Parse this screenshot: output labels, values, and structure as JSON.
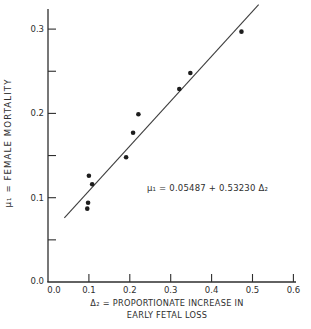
{
  "figure": {
    "background": "#ffffff",
    "ink_color": "#2e2e2e",
    "y_axis_title": "μ₁ = FEMALE  MORTALITY",
    "x_axis_title_line1": "Δ₂ = PROPORTIONATE  INCREASE  IN",
    "x_axis_title_line2": "EARLY  FETAL  LOSS",
    "annotation": "μ₁ = 0.05487 + 0.53230 Δ₂"
  },
  "chart_data": {
    "type": "scatter",
    "title": "",
    "xlabel": "Δ₂ = PROPORTIONATE INCREASE IN EARLY FETAL LOSS",
    "ylabel": "μ₁ = FEMALE MORTALITY",
    "xlim": [
      0,
      0.62
    ],
    "ylim": [
      0,
      0.323
    ],
    "grid": false,
    "legend": null,
    "x_major_ticks": [
      0,
      0.1,
      0.2,
      0.3,
      0.4,
      0.5,
      0.6
    ],
    "x_tick_labels": [
      "0.0",
      "0.1",
      "0.2",
      "0.3",
      "0.4",
      "0.5",
      "0.6"
    ],
    "y_major_ticks": [
      0,
      0.1,
      0.2,
      0.3
    ],
    "y_tick_labels": [
      "0.0",
      "0.1",
      "0.2",
      "0.3"
    ],
    "y_minor_ticks": [
      0.05,
      0.15,
      0.25
    ],
    "points": [
      {
        "x": 0.473,
        "y": 0.297
      },
      {
        "x": 0.348,
        "y": 0.248
      },
      {
        "x": 0.321,
        "y": 0.229
      },
      {
        "x": 0.221,
        "y": 0.199
      },
      {
        "x": 0.208,
        "y": 0.177
      },
      {
        "x": 0.191,
        "y": 0.148
      },
      {
        "x": 0.1,
        "y": 0.126
      },
      {
        "x": 0.108,
        "y": 0.116
      },
      {
        "x": 0.098,
        "y": 0.094
      },
      {
        "x": 0.096,
        "y": 0.087
      }
    ],
    "regression_line": {
      "label": "μ₁ = 0.05487 + 0.53230 Δ₂",
      "intercept": 0.05487,
      "slope": 0.5323,
      "x_start": 0.04,
      "x_end": 0.515
    }
  }
}
